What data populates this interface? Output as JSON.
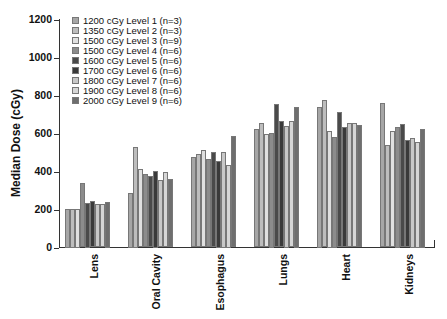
{
  "chart_data": {
    "type": "bar",
    "title": "",
    "xlabel": "",
    "ylabel": "Median Dose (cGy)",
    "ylim": [
      0,
      1200
    ],
    "yticks": [
      0,
      200,
      400,
      600,
      800,
      1000,
      1200
    ],
    "grid": false,
    "legend_position": "top-left inside",
    "categories": [
      "Lens",
      "Oral Cavity",
      "Esophagus",
      "Lungs",
      "Heart",
      "Kidneys"
    ],
    "series": [
      {
        "name": "1200 cGy Level 1 (n=3)",
        "color": "#a6a6a6",
        "values": [
          205,
          287,
          477,
          626,
          742,
          760
        ]
      },
      {
        "name": "1350 cGy Level 2 (n=3)",
        "color": "#bdbdbd",
        "values": [
          205,
          529,
          494,
          656,
          774,
          541
        ]
      },
      {
        "name": "1500 cGy Level 3 (n=9)",
        "color": "#e0e0e0",
        "values": [
          205,
          415,
          515,
          595,
          616,
          611
        ]
      },
      {
        "name": "1500 cGy Level 4 (n=6)",
        "color": "#8c8c8c",
        "values": [
          340,
          388,
          465,
          605,
          584,
          637
        ]
      },
      {
        "name": "1600 cGy Level 5 (n=6)",
        "color": "#4a4a4a",
        "values": [
          237,
          378,
          503,
          755,
          712,
          651
        ]
      },
      {
        "name": "1700 cGy Level 6 (n=6)",
        "color": "#3a3a3a",
        "values": [
          247,
          405,
          455,
          665,
          632,
          567
        ]
      },
      {
        "name": "1800 cGy Level 7 (n=6)",
        "color": "#c8c8c8",
        "values": [
          230,
          354,
          505,
          642,
          653,
          579
        ]
      },
      {
        "name": "1900 cGy Level 8 (n=6)",
        "color": "#d6d6d6",
        "values": [
          230,
          395,
          437,
          665,
          653,
          558
        ]
      },
      {
        "name": "2000 cGy Level 9 (n=6)",
        "color": "#6e6e6e",
        "values": [
          242,
          361,
          589,
          742,
          647,
          625
        ]
      }
    ]
  }
}
